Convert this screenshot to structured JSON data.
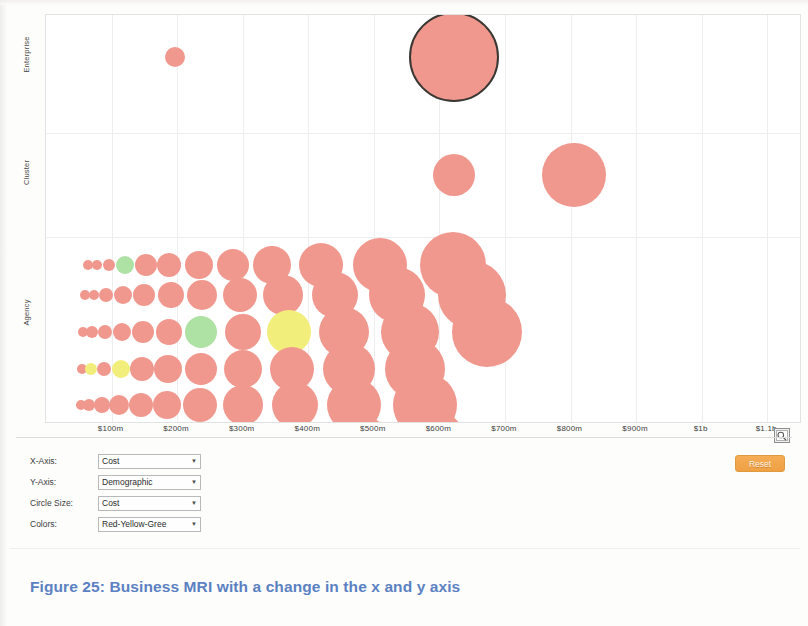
{
  "figure": {
    "caption": "Figure 25: Business MRI with a change in the x and y axis"
  },
  "controls": {
    "rows": [
      {
        "label": "X-Axis:",
        "value": "Cost",
        "name": "x-axis-select"
      },
      {
        "label": "Y-Axis:",
        "value": "Demographic",
        "name": "y-axis-select"
      },
      {
        "label": "Circle Size:",
        "value": "Cost",
        "name": "circle-size-select"
      },
      {
        "label": "Colors:",
        "value": "Red-Yellow-Gree",
        "name": "colors-select"
      }
    ],
    "caret": "▼",
    "reset_label": "Reset"
  },
  "icons": {
    "zoom_tool": "zoom-region-icon"
  },
  "colors": {
    "bubble_red": "#F0988E",
    "bubble_yellow": "#F2EE7C",
    "bubble_green": "#AEE1A4",
    "selected_outline": "#3b3733",
    "accent_orange": "#F0A446",
    "caption_blue": "#5B81C2",
    "grid": "#EEEEEE"
  },
  "chart_data": {
    "type": "scatter",
    "title": "",
    "xlabel": "Cost",
    "ylabel": "Demographic",
    "legend": "none",
    "grid": true,
    "xlim": [
      0,
      1150
    ],
    "xunit": "$ millions",
    "x_tick_values": [
      100,
      200,
      300,
      400,
      500,
      600,
      700,
      800,
      900,
      1000,
      1100
    ],
    "x_tick_labels": [
      "$100m",
      "$200m",
      "$300m",
      "$400m",
      "$500m",
      "$600m",
      "$700m",
      "$800m",
      "$900m",
      "$1b",
      "$1.1b"
    ],
    "y_categories": [
      "Agency",
      "Cluster",
      "Enterprise"
    ],
    "y_tick_labels": [
      "Enterprise",
      "Cluster",
      "Agency"
    ],
    "size_encodes": "Cost",
    "color_encodes": "Red-Yellow-Green",
    "points": [
      {
        "x": 196,
        "y": "Enterprise",
        "r": 10,
        "color": "red"
      },
      {
        "x": 622,
        "y": "Enterprise",
        "r": 45,
        "color": "red",
        "selected": true
      },
      {
        "x": 622,
        "y": "Cluster",
        "r": 21,
        "color": "red"
      },
      {
        "x": 805,
        "y": "Cluster",
        "r": 32,
        "color": "red"
      },
      {
        "x": 64,
        "y": "Agency",
        "r": 5,
        "color": "red"
      },
      {
        "x": 77,
        "y": "Agency",
        "r": 5,
        "color": "red"
      },
      {
        "x": 96,
        "y": "Agency",
        "r": 6,
        "color": "red"
      },
      {
        "x": 120,
        "y": "Agency",
        "r": 9,
        "color": "green"
      },
      {
        "x": 153,
        "y": "Agency",
        "r": 11,
        "color": "red"
      },
      {
        "x": 187,
        "y": "Agency",
        "r": 12,
        "color": "red"
      },
      {
        "x": 233,
        "y": "Agency",
        "r": 14,
        "color": "red"
      },
      {
        "x": 285,
        "y": "Agency",
        "r": 16,
        "color": "red"
      },
      {
        "x": 345,
        "y": "Agency",
        "r": 19,
        "color": "red"
      },
      {
        "x": 420,
        "y": "Agency",
        "r": 22,
        "color": "red"
      },
      {
        "x": 510,
        "y": "Agency",
        "r": 27,
        "color": "red"
      },
      {
        "x": 620,
        "y": "Agency",
        "r": 33,
        "color": "red"
      },
      {
        "x": 60,
        "y": "Agency",
        "r": 5,
        "color": "red"
      },
      {
        "x": 73,
        "y": "Agency",
        "r": 5,
        "color": "red"
      },
      {
        "x": 92,
        "y": "Agency",
        "r": 7,
        "color": "red"
      },
      {
        "x": 118,
        "y": "Agency",
        "r": 9,
        "color": "red"
      },
      {
        "x": 150,
        "y": "Agency",
        "r": 11,
        "color": "red"
      },
      {
        "x": 190,
        "y": "Agency",
        "r": 13,
        "color": "red"
      },
      {
        "x": 238,
        "y": "Agency",
        "r": 15,
        "color": "red"
      },
      {
        "x": 296,
        "y": "Agency",
        "r": 17,
        "color": "red"
      },
      {
        "x": 362,
        "y": "Agency",
        "r": 20,
        "color": "red"
      },
      {
        "x": 440,
        "y": "Agency",
        "r": 23,
        "color": "red"
      },
      {
        "x": 535,
        "y": "Agency",
        "r": 28,
        "color": "red"
      },
      {
        "x": 650,
        "y": "Agency",
        "r": 34,
        "color": "red"
      },
      {
        "x": 57,
        "y": "Agency",
        "r": 5,
        "color": "red"
      },
      {
        "x": 70,
        "y": "Agency",
        "r": 6,
        "color": "red"
      },
      {
        "x": 90,
        "y": "Agency",
        "r": 7,
        "color": "red"
      },
      {
        "x": 116,
        "y": "Agency",
        "r": 9,
        "color": "red"
      },
      {
        "x": 148,
        "y": "Agency",
        "r": 11,
        "color": "red"
      },
      {
        "x": 188,
        "y": "Agency",
        "r": 13,
        "color": "red"
      },
      {
        "x": 237,
        "y": "Agency",
        "r": 16,
        "color": "green"
      },
      {
        "x": 300,
        "y": "Agency",
        "r": 18,
        "color": "red"
      },
      {
        "x": 370,
        "y": "Agency",
        "r": 22,
        "color": "yellow"
      },
      {
        "x": 455,
        "y": "Agency",
        "r": 25,
        "color": "red"
      },
      {
        "x": 555,
        "y": "Agency",
        "r": 29,
        "color": "red"
      },
      {
        "x": 672,
        "y": "Agency",
        "r": 35,
        "color": "red"
      },
      {
        "x": 55,
        "y": "Agency",
        "r": 5,
        "color": "red"
      },
      {
        "x": 68,
        "y": "Agency",
        "r": 6,
        "color": "yellow"
      },
      {
        "x": 88,
        "y": "Agency",
        "r": 7,
        "color": "red"
      },
      {
        "x": 114,
        "y": "Agency",
        "r": 9,
        "color": "yellow"
      },
      {
        "x": 146,
        "y": "Agency",
        "r": 12,
        "color": "red"
      },
      {
        "x": 186,
        "y": "Agency",
        "r": 14,
        "color": "red"
      },
      {
        "x": 236,
        "y": "Agency",
        "r": 16,
        "color": "red"
      },
      {
        "x": 300,
        "y": "Agency",
        "r": 19,
        "color": "red"
      },
      {
        "x": 375,
        "y": "Agency",
        "r": 22,
        "color": "red"
      },
      {
        "x": 462,
        "y": "Agency",
        "r": 26,
        "color": "red"
      },
      {
        "x": 562,
        "y": "Agency",
        "r": 30,
        "color": "red"
      },
      {
        "x": 53,
        "y": "Agency",
        "r": 5,
        "color": "red"
      },
      {
        "x": 66,
        "y": "Agency",
        "r": 6,
        "color": "red"
      },
      {
        "x": 86,
        "y": "Agency",
        "r": 8,
        "color": "red"
      },
      {
        "x": 112,
        "y": "Agency",
        "r": 10,
        "color": "red"
      },
      {
        "x": 145,
        "y": "Agency",
        "r": 12,
        "color": "red"
      },
      {
        "x": 185,
        "y": "Agency",
        "r": 14,
        "color": "red"
      },
      {
        "x": 235,
        "y": "Agency",
        "r": 17,
        "color": "red"
      },
      {
        "x": 300,
        "y": "Agency",
        "r": 20,
        "color": "red"
      },
      {
        "x": 380,
        "y": "Agency",
        "r": 23,
        "color": "red"
      },
      {
        "x": 470,
        "y": "Agency",
        "r": 27,
        "color": "red"
      },
      {
        "x": 578,
        "y": "Agency",
        "r": 32,
        "color": "red"
      },
      {
        "x": 52,
        "y": "Agency",
        "r": 5,
        "color": "red"
      },
      {
        "x": 65,
        "y": "Agency",
        "r": 6,
        "color": "red"
      },
      {
        "x": 85,
        "y": "Agency",
        "r": 8,
        "color": "red"
      },
      {
        "x": 111,
        "y": "Agency",
        "r": 10,
        "color": "red"
      },
      {
        "x": 144,
        "y": "Agency",
        "r": 13,
        "color": "yellow"
      },
      {
        "x": 184,
        "y": "Agency",
        "r": 15,
        "color": "red"
      },
      {
        "x": 236,
        "y": "Agency",
        "r": 18,
        "color": "red"
      },
      {
        "x": 302,
        "y": "Agency",
        "r": 21,
        "color": "red"
      },
      {
        "x": 385,
        "y": "Agency",
        "r": 24,
        "color": "red"
      },
      {
        "x": 480,
        "y": "Agency",
        "r": 28,
        "color": "red"
      },
      {
        "x": 590,
        "y": "Agency",
        "r": 33,
        "color": "red"
      }
    ]
  }
}
